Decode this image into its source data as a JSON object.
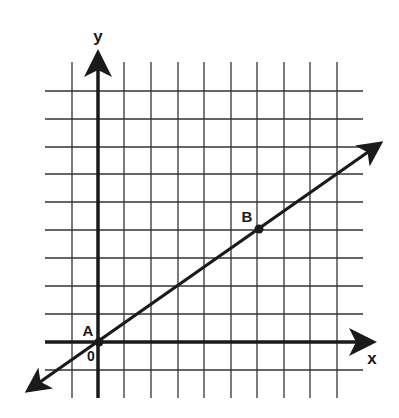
{
  "diagram": {
    "type": "coordinate-plane",
    "axes": {
      "x_label": "x",
      "y_label": "y",
      "origin_label": "0"
    },
    "grid": {
      "x_range": [
        -1,
        9
      ],
      "y_range": [
        -1,
        9
      ],
      "step": 1
    },
    "points": [
      {
        "label": "A",
        "x": 0,
        "y": 0
      },
      {
        "label": "B",
        "x": 6,
        "y": 4
      }
    ],
    "line": {
      "through": [
        "A",
        "B"
      ],
      "slope": "2/3",
      "arrows": "both"
    },
    "colors": {
      "ink": "#1a1a1a",
      "grid": "#333333",
      "background": "#ffffff"
    }
  }
}
